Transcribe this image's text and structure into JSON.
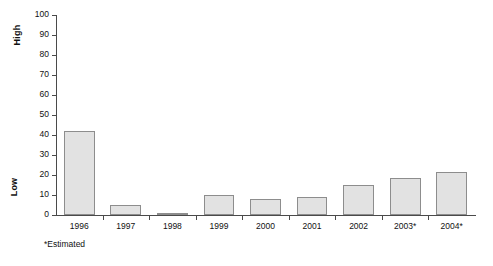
{
  "chart_data": {
    "type": "bar",
    "title": "",
    "subtitle": "",
    "xlabel": "",
    "ylabel": "",
    "categories": [
      "1996",
      "1997",
      "1998",
      "1999",
      "2000",
      "2001",
      "2002",
      "2003*",
      "2004*"
    ],
    "values": [
      42,
      5,
      1,
      10,
      8,
      9,
      15,
      18.5,
      21.5
    ],
    "ylim": [
      0,
      100
    ],
    "yticks": [
      0,
      10,
      20,
      30,
      40,
      50,
      60,
      70,
      80,
      90,
      100
    ],
    "ytick_labels": [
      "0",
      "10",
      "20",
      "30",
      "40",
      "50",
      "60",
      "70",
      "80",
      "90",
      "100"
    ],
    "grid": false,
    "legend": false,
    "axis_group_labels": {
      "top": "High",
      "bottom": "Low"
    },
    "annotations": {
      "footnote": "*Estimated"
    },
    "colors": {
      "bar_fill": "#e2e2e2",
      "bar_stroke": "#8d8d8d",
      "axis": "#4a4a4a",
      "text": "#111111",
      "background": "#ffffff"
    }
  }
}
